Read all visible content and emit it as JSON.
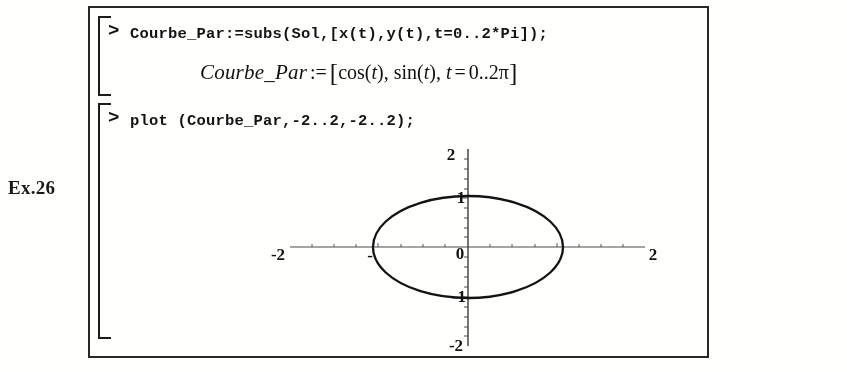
{
  "margin": {
    "exercise_label": "Ex.26"
  },
  "worksheet": {
    "prompt_symbol": ">",
    "groups": [
      {
        "input": "Courbe_Par:=subs(Sol,[x(t),y(t),t=0..2*Pi]);",
        "output_text": "Courbe_Par := [cos(t), sin(t), t = 0..2π]",
        "output_parts": {
          "lhs": "Courbe_Par",
          "assign_op": ":=",
          "open_bracket": "[",
          "term_1_func": "cos",
          "term_1_open": "(",
          "term_1_arg": "t",
          "term_1_close": ")",
          "comma_1": ",",
          "term_2_func": "sin",
          "term_2_open": "(",
          "term_2_arg": "t",
          "term_2_close": ")",
          "comma_2": ",",
          "range_var": "t",
          "range_eq": "=",
          "range_value": "0..2π",
          "close_bracket": "]"
        }
      },
      {
        "input": "plot (Courbe_Par,-2..2,-2..2);",
        "output_text": ""
      }
    ]
  },
  "chart_data": {
    "type": "line",
    "title": "",
    "subtitle": "",
    "xlabel": "",
    "ylabel": "",
    "xlim": [
      -2,
      2
    ],
    "ylim": [
      -2,
      2
    ],
    "grid": false,
    "legend": null,
    "axes_style": "crossed-at-origin",
    "x_tick_labels": [
      "-2",
      "0",
      "2"
    ],
    "y_tick_labels": [
      "-2",
      "-1",
      "0",
      "1",
      "2"
    ],
    "x_ticks": [
      -2,
      0,
      2
    ],
    "y_ticks": [
      -2,
      -1,
      0,
      1,
      2
    ],
    "origin_label": "0",
    "series": [
      {
        "name": "Courbe_Par",
        "parametric": true,
        "x_expression": "cos(t)",
        "y_expression": "sin(t)",
        "t_range": [
          0,
          6.283185307179586
        ],
        "t_range_label": "0..2π",
        "shape": "unit circle",
        "radius": 1,
        "center": [
          0,
          0
        ],
        "color": "#151515",
        "points": [
          [
            1.0,
            0.0
          ],
          [
            0.866,
            0.5
          ],
          [
            0.5,
            0.866
          ],
          [
            0.0,
            1.0
          ],
          [
            -0.5,
            0.866
          ],
          [
            -0.866,
            0.5
          ],
          [
            -1.0,
            0.0
          ],
          [
            -0.866,
            -0.5
          ],
          [
            -0.5,
            -0.866
          ],
          [
            0.0,
            -1.0
          ],
          [
            0.5,
            -0.866
          ],
          [
            0.866,
            -0.5
          ],
          [
            1.0,
            0.0
          ]
        ]
      }
    ]
  }
}
